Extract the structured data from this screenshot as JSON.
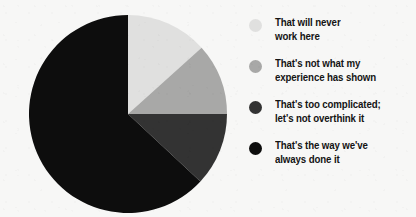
{
  "chart_data": {
    "type": "pie",
    "title": "",
    "subtitle": "",
    "xlabel": "",
    "ylabel": "",
    "grid": false,
    "legend_position": "right",
    "start_angle_deg": 0,
    "direction": "clockwise",
    "categories": [
      "That will never work here",
      "That's not what my experience has shown",
      "That's too complicated; let's not overthink it",
      "That's the way we've always done it"
    ],
    "values": [
      13,
      12,
      12,
      63
    ],
    "slices": [
      {
        "label": "That will never work here",
        "value": 13,
        "color": "#e0e0df",
        "start_angle_deg": 0,
        "end_angle_deg": 48
      },
      {
        "label": "That's not what my experience has shown",
        "value": 12,
        "color": "#a8a8a7",
        "start_angle_deg": 48,
        "end_angle_deg": 90
      },
      {
        "label": "That's too complicated; let's not overthink it",
        "value": 12,
        "color": "#333333",
        "start_angle_deg": 90,
        "end_angle_deg": 133
      },
      {
        "label": "That's the way we've always done it",
        "value": 63,
        "color": "#0d0d0d",
        "start_angle_deg": 133,
        "end_angle_deg": 360
      }
    ]
  },
  "legend": {
    "items": [
      {
        "label": "That will never\nwork here",
        "color": "#e0e0df",
        "swatch_name": "legend-swatch-never-work-here"
      },
      {
        "label": "That's not what my\nexperience has shown",
        "color": "#a8a8a7",
        "swatch_name": "legend-swatch-not-my-experience"
      },
      {
        "label": "That's too complicated;\nlet's not overthink it",
        "color": "#333333",
        "swatch_name": "legend-swatch-too-complicated"
      },
      {
        "label": "That's the way we've\nalways done it",
        "color": "#0d0d0d",
        "swatch_name": "legend-swatch-always-done-it"
      }
    ]
  },
  "colors": {
    "background": "#f7f7f6",
    "text": "#141414",
    "slice_lightest": "#e0e0df",
    "slice_medium": "#a8a8a7",
    "slice_dark": "#333333",
    "slice_black": "#0d0d0d"
  }
}
